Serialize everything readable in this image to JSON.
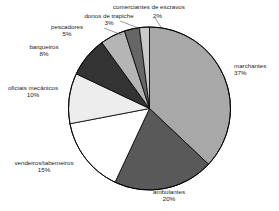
{
  "chart_data": {
    "type": "pie",
    "title": "",
    "subtitle": "",
    "xlabel": "",
    "ylabel": "",
    "legend_position": "none",
    "grid": false,
    "start_angle_deg": 0,
    "direction": "clockwise",
    "units": "percent",
    "categories": [
      "marchantes",
      "ambulantes",
      "vendeiros/tabemeiros",
      "oficiais mecânicos",
      "barqueiros",
      "pescadores",
      "donos de trapiche",
      "comerciantes de escravos"
    ],
    "values": [
      37,
      20,
      15,
      10,
      8,
      5,
      3,
      2
    ],
    "value_labels": [
      "37%",
      "20%",
      "15%",
      "10%",
      "8%",
      "5%",
      "3%",
      "2%"
    ],
    "colors": [
      "#a8a8a8",
      "#595959",
      "#ffffff",
      "#ededed",
      "#333333",
      "#b5b5b5",
      "#666666",
      "#c9c9c9"
    ],
    "slice_border_color": "#000000",
    "slices": [
      {
        "label": "marchantes",
        "value": 37,
        "value_label": "37%",
        "color": "#a8a8a8"
      },
      {
        "label": "ambulantes",
        "value": 20,
        "value_label": "20%",
        "color": "#595959"
      },
      {
        "label": "vendeiros/tabemeiros",
        "value": 15,
        "value_label": "15%",
        "color": "#ffffff"
      },
      {
        "label": "oficiais mecânicos",
        "value": 10,
        "value_label": "10%",
        "color": "#ededed"
      },
      {
        "label": "barqueiros",
        "value": 8,
        "value_label": "8%",
        "color": "#333333"
      },
      {
        "label": "pescadores",
        "value": 5,
        "value_label": "5%",
        "color": "#b5b5b5"
      },
      {
        "label": "donos de trapiche",
        "value": 3,
        "value_label": "3%",
        "color": "#666666"
      },
      {
        "label": "comerciantes de escravos",
        "value": 2,
        "value_label": "2%",
        "color": "#c9c9c9"
      }
    ]
  },
  "labels": {
    "marchantes": {
      "name": "marchantes",
      "pct": "37%"
    },
    "ambulantes": {
      "name": "ambulantes",
      "pct": "20%"
    },
    "vendeiros": {
      "name": "vendeiros/tabemeiros",
      "pct": "15%"
    },
    "oficiais": {
      "name": "oficiais mecânicos",
      "pct": "10%"
    },
    "barqueiros": {
      "name": "barqueiros",
      "pct": "8%"
    },
    "pescadores": {
      "name": "pescadores",
      "pct": "5%"
    },
    "trapiche": {
      "name": "donos de trapiche",
      "pct": "3%"
    },
    "escravos": {
      "name": "comerciantes de escravos",
      "pct": "2%"
    }
  }
}
